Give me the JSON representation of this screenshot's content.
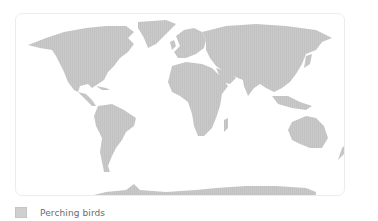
{
  "map": {
    "projection": "world",
    "land_color": "#c9c9c9",
    "frame_border_color": "#ececec",
    "background_color": "#ffffff"
  },
  "legend": {
    "items": [
      {
        "label": "Perching birds",
        "swatch_color": "#cfcfcf"
      }
    ]
  }
}
